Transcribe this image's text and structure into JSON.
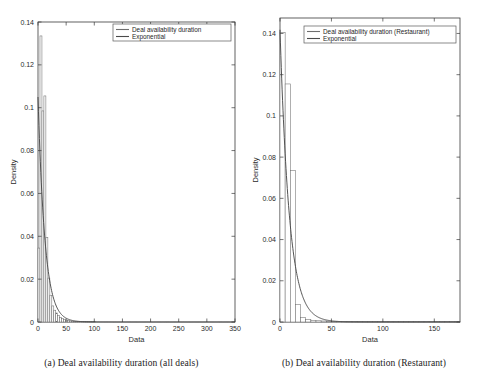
{
  "figure": {
    "panels": [
      {
        "id": "a",
        "caption": "(a)  Deal availability duration (all deals)",
        "chart_data": {
          "type": "bar",
          "title": "",
          "xlabel": "Data",
          "ylabel": "Density",
          "xlim": [
            0,
            350
          ],
          "ylim": [
            0,
            0.14
          ],
          "xticks": [
            0,
            50,
            100,
            150,
            200,
            250,
            300,
            350
          ],
          "xticklabels": [
            "0",
            "50",
            "100",
            "150",
            "200",
            "250",
            "300",
            "350"
          ],
          "yticks": [
            0,
            0.02,
            0.04,
            0.06,
            0.08,
            0.1,
            0.12,
            0.14
          ],
          "yticklabels": [
            "0",
            "0.02",
            "0.04",
            "0.06",
            "0.08",
            "0.1",
            "0.12",
            "0.14"
          ],
          "grid": false,
          "legend_position": "upper right",
          "legend": [
            "Deal availability duration",
            "Exponential"
          ],
          "bin_width": 3.5,
          "categories": [
            1.75,
            5.25,
            8.75,
            12.25,
            15.75,
            19.25,
            22.75,
            26.25,
            29.75,
            33.25,
            36.75,
            40.25,
            43.75,
            47.25,
            50.75,
            54.25,
            57.75,
            61.25,
            64.75,
            68.25,
            71.75,
            75.25,
            78.75,
            82.25,
            85.75,
            89.25,
            92.75,
            96.25,
            99.75
          ],
          "values": [
            0.0345,
            0.1335,
            0.0985,
            0.1055,
            0.0395,
            0.0205,
            0.0125,
            0.0075,
            0.0055,
            0.0042,
            0.003,
            0.0022,
            0.0016,
            0.0012,
            0.0009,
            0.0007,
            0.0005,
            0.0004,
            0.0003,
            0.00025,
            0.0002,
            0.00015,
            0.00012,
            0.0001,
            8e-05,
            6e-05,
            5e-05,
            4e-05,
            3e-05
          ],
          "series": [
            {
              "name": "Deal availability duration",
              "type": "bar",
              "color": "#6e6e6e"
            },
            {
              "name": "Exponential",
              "type": "line",
              "color": "#4a4a4a",
              "rate": 0.0815,
              "scale": 0.105
            }
          ]
        }
      },
      {
        "id": "b",
        "caption": "(b)  Deal availability duration (Restaurant)",
        "chart_data": {
          "type": "bar",
          "title": "",
          "xlabel": "Data",
          "ylabel": "Density",
          "xlim": [
            0,
            175
          ],
          "ylim": [
            0,
            0.1475
          ],
          "xticks": [
            0,
            50,
            100,
            150
          ],
          "xticklabels": [
            "0",
            "50",
            "100",
            "150"
          ],
          "yticks": [
            0,
            0.02,
            0.04,
            0.06,
            0.08,
            0.1,
            0.12,
            0.14
          ],
          "yticklabels": [
            "0",
            "0.02",
            "0.04",
            "0.06",
            "0.08",
            "0.1",
            "0.12",
            "0.14"
          ],
          "grid": false,
          "legend_position": "upper right",
          "legend": [
            "Deal availability duration (Restaurant)",
            "Exponential"
          ],
          "bin_width": 5.0,
          "categories": [
            2.5,
            7.5,
            12.5,
            17.5,
            22.5,
            27.5,
            32.5,
            37.5,
            42.5,
            47.5,
            52.5,
            57.5,
            62.5,
            67.5,
            72.5,
            77.5,
            82.5,
            87.5,
            92.5,
            97.5,
            102.5,
            107.5,
            112.5,
            117.5,
            122.5,
            127.5,
            132.5,
            137.5,
            142.5,
            147.5,
            152.5,
            157.5,
            162.5,
            167.5,
            172.5
          ],
          "values": [
            0.1405,
            0.1155,
            0.0735,
            0.0085,
            0.0022,
            0.0012,
            0.0008,
            0.0006,
            0.0005,
            0.0004,
            0.00035,
            0.0003,
            0.00035,
            0.0003,
            0.00025,
            0.0002,
            0.0002,
            0.00015,
            0.00015,
            0.0001,
            0.0001,
            9e-05,
            8e-05,
            7e-05,
            6e-05,
            5e-05,
            5e-05,
            4e-05,
            4e-05,
            3e-05,
            3e-05,
            2e-05,
            2e-05,
            2e-05,
            1e-05
          ],
          "series": [
            {
              "name": "Deal availability duration (Restaurant)",
              "type": "bar",
              "color": "#6e6e6e"
            },
            {
              "name": "Exponential",
              "type": "line",
              "color": "#4a4a4a",
              "rate": 0.1105,
              "scale": 0.1418
            }
          ]
        }
      }
    ]
  }
}
